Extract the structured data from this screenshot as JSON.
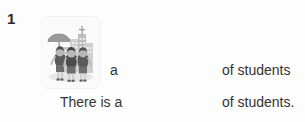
{
  "exercise": {
    "number": "1",
    "picture": {
      "icon_name": "students-walking-city-illustration",
      "alt": "Three students walking together with an umbrella in front of city buildings"
    },
    "prompt_line": {
      "article": "a",
      "blank": "",
      "tail": "of students"
    },
    "answer_line": {
      "head": "There is a",
      "blank": "",
      "tail": "of students."
    }
  },
  "colors": {
    "page_background": "#fdfdfd",
    "text": "#343434",
    "number": "#2b2b2b",
    "card_background": "#fafafa",
    "illustration_dark": "#4a4a4a",
    "illustration_mid": "#8d8d8d",
    "illustration_light": "#c9c9c9"
  }
}
